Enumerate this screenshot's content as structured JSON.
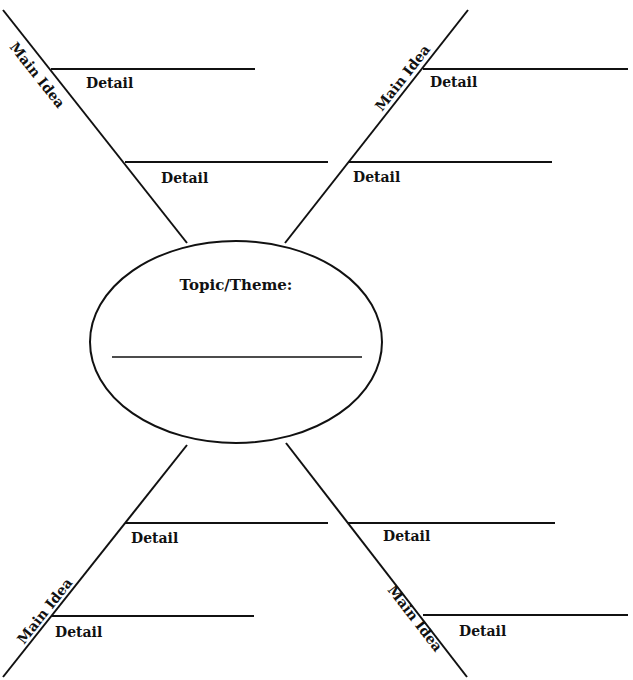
{
  "diagram": {
    "type": "spider-map graphic organizer",
    "center": {
      "label": "Topic/Theme:",
      "answer_line": ""
    },
    "branches": [
      {
        "position": "top-left",
        "main_idea_label": "Main Idea",
        "details": [
          {
            "label": "Detail",
            "value": ""
          },
          {
            "label": "Detail",
            "value": ""
          }
        ]
      },
      {
        "position": "top-right",
        "main_idea_label": "Main Idea",
        "details": [
          {
            "label": "Detail",
            "value": ""
          },
          {
            "label": "Detail",
            "value": ""
          }
        ]
      },
      {
        "position": "bottom-left",
        "main_idea_label": "Main Idea",
        "details": [
          {
            "label": "Detail",
            "value": ""
          },
          {
            "label": "Detail",
            "value": ""
          }
        ]
      },
      {
        "position": "bottom-right",
        "main_idea_label": "Main Idea",
        "details": [
          {
            "label": "Detail",
            "value": ""
          },
          {
            "label": "Detail",
            "value": ""
          }
        ]
      }
    ],
    "colors": {
      "line": "#111111",
      "background": "#ffffff"
    }
  }
}
